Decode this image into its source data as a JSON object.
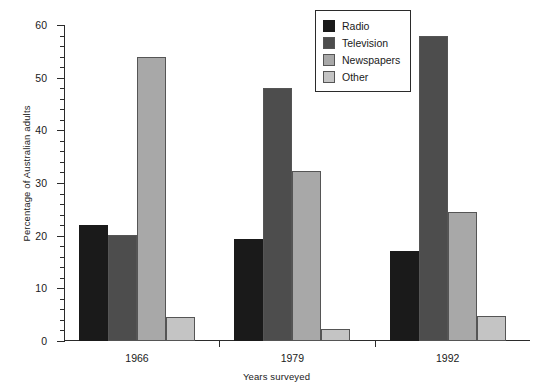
{
  "chart_data": {
    "type": "bar",
    "title": "",
    "xlabel": "Years surveyed",
    "ylabel": "Percentage of Australian adults",
    "categories": [
      "1966",
      "1979",
      "1992"
    ],
    "series": [
      {
        "name": "Radio",
        "color": "#1a1a1a",
        "values": [
          22.0,
          19.3,
          17.0
        ]
      },
      {
        "name": "Television",
        "color": "#4d4d4d",
        "values": [
          20.2,
          48.0,
          58.0
        ]
      },
      {
        "name": "Newspapers",
        "color": "#a8a8a8",
        "values": [
          54.0,
          32.3,
          24.5
        ]
      },
      {
        "name": "Other",
        "color": "#c4c4c4",
        "values": [
          4.5,
          2.2,
          4.8
        ]
      }
    ],
    "ylim": [
      0,
      60
    ],
    "ytick_labels": [
      "0",
      "10",
      "20",
      "30",
      "40",
      "50",
      "60"
    ],
    "ytick_values": [
      0,
      10,
      20,
      30,
      40,
      50,
      60
    ],
    "yminor_step": 2,
    "grid": false,
    "legend_position": "top-right",
    "legend_entries": [
      "Radio",
      "Television",
      "Newspapers",
      "Other"
    ]
  },
  "axis": {
    "y_title": "Percentage of Australian adults",
    "x_title": "Years surveyed"
  }
}
